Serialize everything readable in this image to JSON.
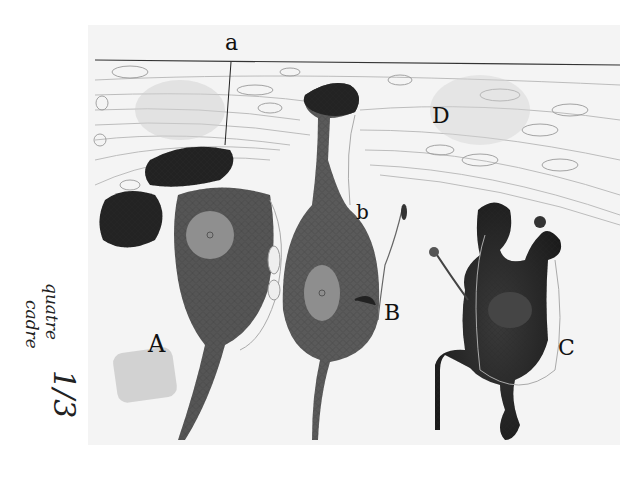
{
  "figure": {
    "kind": "histological pencil drawing",
    "labels": {
      "a": "a",
      "b": "b",
      "A": "A",
      "B": "B",
      "C": "C",
      "D": "D"
    },
    "handwritten_note": {
      "line1": "quatre",
      "line2": "cadre",
      "fraction": "1/3"
    },
    "colors": {
      "paper": "#f4f4f4",
      "background": "#ffffff",
      "ink_dark": "#1e1e1e",
      "cell_body": "#5a5a5a",
      "nucleus": "#8e8e8e",
      "fiber_line": "#b8b8b8",
      "smudge": "#c8c8c8"
    }
  }
}
